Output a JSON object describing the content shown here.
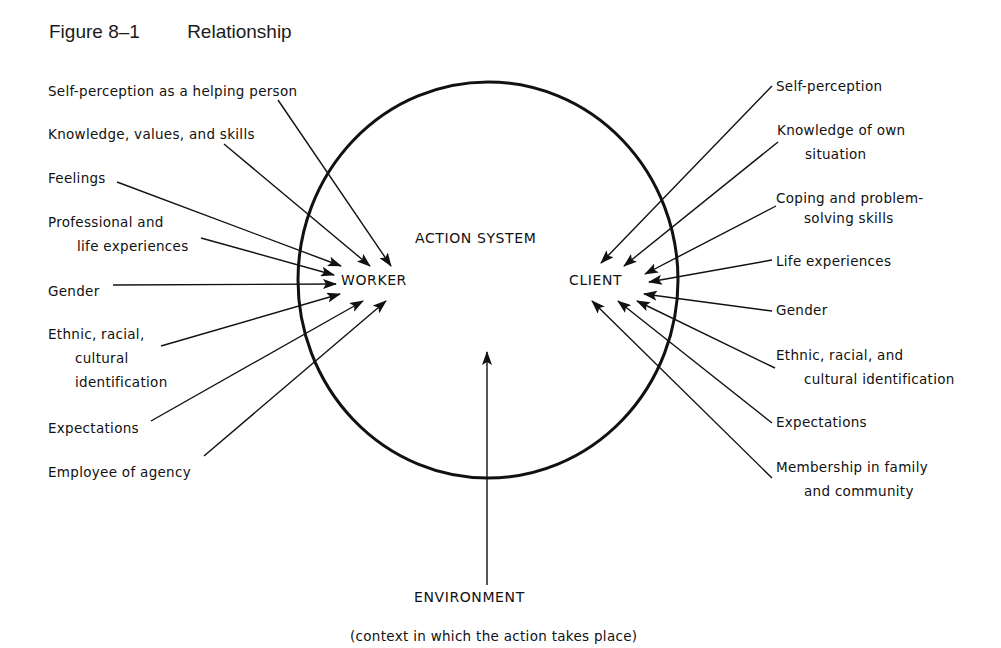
{
  "figure": {
    "number": "Figure 8–1",
    "title": "Relationship"
  },
  "center": {
    "system_label": "ACTION SYSTEM",
    "worker_label": "WORKER",
    "client_label": "CLIENT"
  },
  "worker_inputs": [
    {
      "line1": "Self-perception as a helping person",
      "line2": ""
    },
    {
      "line1": "Knowledge, values, and skills",
      "line2": ""
    },
    {
      "line1": "Feelings",
      "line2": ""
    },
    {
      "line1": "Professional and",
      "line2": "life experiences"
    },
    {
      "line1": "Gender",
      "line2": ""
    },
    {
      "line1": "Ethnic, racial,",
      "line2": "cultural",
      "line3": "identification"
    },
    {
      "line1": "Expectations",
      "line2": ""
    },
    {
      "line1": "Employee of agency",
      "line2": ""
    }
  ],
  "client_inputs": [
    {
      "line1": "Self-perception",
      "line2": ""
    },
    {
      "line1": "Knowledge of own",
      "line2": "situation"
    },
    {
      "line1": "Coping and problem-",
      "line2": "solving skills"
    },
    {
      "line1": "Life experiences",
      "line2": ""
    },
    {
      "line1": "Gender",
      "line2": ""
    },
    {
      "line1": "Ethnic, racial, and",
      "line2": "cultural identification"
    },
    {
      "line1": "Expectations",
      "line2": ""
    },
    {
      "line1": "Membership in family",
      "line2": "and community"
    }
  ],
  "environment": {
    "label": "ENVIRONMENT",
    "caption": "(context in which the action takes place)"
  },
  "colors": {
    "ink": "#111111",
    "background": "#ffffff"
  }
}
